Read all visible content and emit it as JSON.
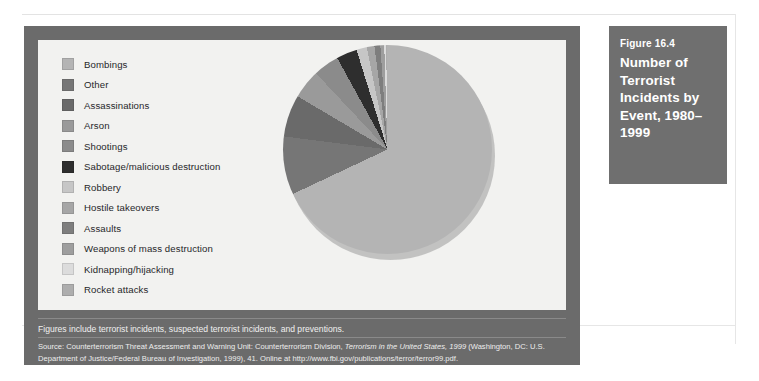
{
  "figure": {
    "number_label": "Figure 16.4",
    "title": "Number of Terrorist Incidents by Event, 1980–1999",
    "note": "Figures include terrorist incidents, suspected terrorist incidents, and preventions.",
    "source_prefix": "Source: Counterterrorism Threat Assessment and Warning Unit: Counterterrorism Division, ",
    "source_italic": "Terrorism in the United States, 1999",
    "source_suffix": " (Washington, DC: U.S. Department of Justice/Federal Bureau of Investigation, 1999), 41. Online at http://www.fbi.gov/publications/terror/terror99.pdf."
  },
  "colors": {
    "panel_background": "#6b6b6b",
    "title_background": "#6f6f6f",
    "plot_background": "#f2f2f0",
    "page_background": "#ffffff",
    "title_text": "#ffffff",
    "caption_text": "#f0f0f0"
  },
  "chart_data": {
    "type": "pie",
    "title": "Number of Terrorist Incidents by Event, 1980–1999",
    "xlabel": "",
    "ylabel": "",
    "legend_position": "left",
    "grid": false,
    "start_angle_deg": 0,
    "direction": "clockwise",
    "categories": [
      "Bombings",
      "Other",
      "Assassinations",
      "Arson",
      "Shootings",
      "Sabotage/malicious destruction",
      "Robbery",
      "Hostile takeovers",
      "Assaults",
      "Weapons of mass destruction",
      "Kidnapping/hijacking",
      "Rocket attacks"
    ],
    "values": [
      68.0,
      9.0,
      6.5,
      4.5,
      4.0,
      3.2,
      1.6,
      1.2,
      0.9,
      0.6,
      0.3,
      0.2
    ],
    "slice_colors": [
      "#b4b4b4",
      "#767676",
      "#6a6a6a",
      "#9a9a9a",
      "#8b8b8b",
      "#2e2e2e",
      "#c6c6c6",
      "#a6a6a6",
      "#7e7e7e",
      "#9e9e9e",
      "#dcdcdc",
      "#aeaeae"
    ],
    "legend_swatch_colors": [
      "#b4b4b4",
      "#767676",
      "#6a6a6a",
      "#9a9a9a",
      "#8b8b8b",
      "#2e2e2e",
      "#c6c6c6",
      "#a6a6a6",
      "#7e7e7e",
      "#9e9e9e",
      "#dcdcdc",
      "#aeaeae"
    ]
  }
}
